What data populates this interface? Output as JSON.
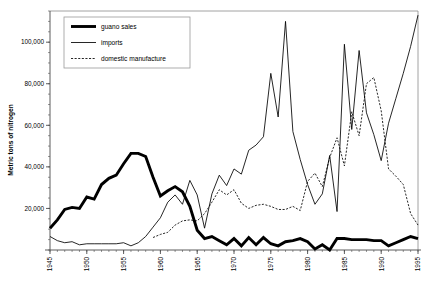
{
  "chart_data": {
    "type": "line",
    "title": "",
    "xlabel": "",
    "ylabel": "Metric tons of nitrogen",
    "xlim": [
      1945,
      1995
    ],
    "ylim": [
      0,
      115000
    ],
    "grid": false,
    "legend_position": "top-left",
    "x_tick_labels": [
      "1945",
      "1950",
      "1955",
      "1960",
      "1965",
      "1970",
      "1975",
      "1980",
      "1985",
      "1990",
      "1995"
    ],
    "x_tick_values": [
      1945,
      1950,
      1955,
      1960,
      1965,
      1970,
      1975,
      1980,
      1985,
      1990,
      1995
    ],
    "x_minor_tick_interval": 1,
    "y_tick_labels": [
      "20,000",
      "40,000",
      "60,000",
      "80,000",
      "100,000"
    ],
    "y_tick_values": [
      20000,
      40000,
      60000,
      80000,
      100000
    ],
    "y_minor_tick_interval": 5000,
    "series": [
      {
        "name": "guano sales",
        "style": "thick-solid",
        "color": "#000000",
        "x": [
          1945,
          1946,
          1947,
          1948,
          1949,
          1950,
          1951,
          1952,
          1953,
          1954,
          1955,
          1956,
          1957,
          1958,
          1959,
          1960,
          1961,
          1962,
          1963,
          1964,
          1965,
          1966,
          1967,
          1968,
          1969,
          1970,
          1971,
          1972,
          1973,
          1974,
          1975,
          1976,
          1977,
          1978,
          1979,
          1980,
          1981,
          1982,
          1983,
          1984,
          1985,
          1986,
          1987,
          1988,
          1989,
          1990,
          1991,
          1992,
          1993,
          1994,
          1995
        ],
        "values": [
          10500,
          14500,
          19500,
          20500,
          20000,
          25500,
          24500,
          31500,
          34500,
          36000,
          41500,
          46500,
          46500,
          45000,
          35000,
          26000,
          28500,
          30500,
          28000,
          21000,
          9500,
          5500,
          6500,
          4500,
          2500,
          5500,
          2000,
          6000,
          2500,
          6000,
          3000,
          2000,
          4000,
          4500,
          5500,
          4000,
          500,
          2500,
          0,
          5500,
          5500,
          5000,
          5000,
          5000,
          4500,
          4500,
          2000,
          3500,
          5000,
          6500,
          5500
        ]
      },
      {
        "name": "imports",
        "style": "thin-solid",
        "color": "#000000",
        "x": [
          1945,
          1946,
          1947,
          1948,
          1949,
          1950,
          1951,
          1952,
          1953,
          1954,
          1955,
          1956,
          1957,
          1958,
          1959,
          1960,
          1961,
          1962,
          1963,
          1964,
          1965,
          1966,
          1967,
          1968,
          1969,
          1970,
          1971,
          1972,
          1973,
          1974,
          1975,
          1976,
          1977,
          1978,
          1979,
          1980,
          1981,
          1982,
          1983,
          1984,
          1985,
          1986,
          1987,
          1988,
          1989,
          1990,
          1991,
          1992,
          1993,
          1994,
          1995
        ],
        "values": [
          6500,
          4500,
          3500,
          4000,
          2500,
          3000,
          3000,
          3000,
          3000,
          3000,
          3500,
          2000,
          3500,
          6500,
          11000,
          15500,
          23000,
          26500,
          22000,
          33500,
          26500,
          10500,
          27000,
          36000,
          31000,
          39000,
          36500,
          48000,
          50500,
          54500,
          85000,
          64000,
          110000,
          57000,
          43500,
          31500,
          22000,
          27000,
          45500,
          18500,
          99000,
          58000,
          96000,
          66000,
          55500,
          43000,
          61000,
          73000,
          85000,
          98000,
          113000
        ]
      },
      {
        "name": "domestic manufacture",
        "style": "dotted",
        "color": "#000000",
        "x": [
          1959,
          1960,
          1961,
          1962,
          1963,
          1964,
          1965,
          1966,
          1967,
          1968,
          1969,
          1970,
          1971,
          1972,
          1973,
          1974,
          1975,
          1976,
          1977,
          1978,
          1979,
          1980,
          1981,
          1982,
          1983,
          1984,
          1985,
          1986,
          1987,
          1988,
          1989,
          1990,
          1991,
          1992,
          1993,
          1994,
          1995
        ],
        "values": [
          6000,
          7500,
          8500,
          12000,
          14000,
          14500,
          14000,
          17500,
          23000,
          29000,
          26500,
          29000,
          22500,
          20000,
          21500,
          22000,
          21000,
          19500,
          19500,
          21000,
          19000,
          33000,
          37000,
          30500,
          44500,
          54000,
          40500,
          66500,
          55000,
          80000,
          83000,
          67000,
          39000,
          35500,
          31500,
          17500,
          12000
        ]
      }
    ]
  },
  "legend": {
    "entries": [
      {
        "label": "guano sales"
      },
      {
        "label": "imports"
      },
      {
        "label": "domestic manufacture"
      }
    ]
  }
}
